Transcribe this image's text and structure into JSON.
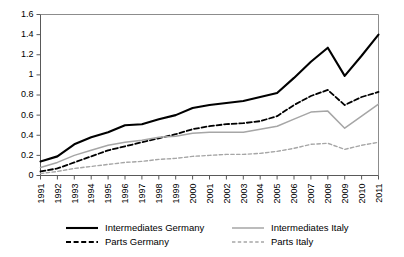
{
  "chart_data": {
    "type": "line",
    "title": "",
    "subtitle": "",
    "xlabel": "",
    "ylabel": "",
    "x": [
      "1991",
      "1992",
      "1993",
      "1994",
      "1995",
      "1996",
      "1997",
      "1998",
      "1999",
      "2000",
      "2001",
      "2002",
      "2003",
      "2004",
      "2005",
      "2006",
      "2007",
      "2008",
      "2009",
      "2010",
      "2011"
    ],
    "categories": [
      "1991",
      "1992",
      "1993",
      "1994",
      "1995",
      "1996",
      "1997",
      "1998",
      "1999",
      "2000",
      "2001",
      "2002",
      "2003",
      "2004",
      "2005",
      "2006",
      "2007",
      "2008",
      "2009",
      "2010",
      "2011"
    ],
    "ylim": [
      0,
      1.6
    ],
    "yticks": [
      "0",
      "0.2",
      "0.4",
      "0.6",
      "0.8",
      "1",
      "1.2",
      "1.4",
      "1.6"
    ],
    "ytick_values": [
      0,
      0.2,
      0.4,
      0.6,
      0.8,
      1.0,
      1.2,
      1.4,
      1.6
    ],
    "grid": false,
    "legend_position": "bottom",
    "series": [
      {
        "name": "Intermediates Germany",
        "style": "solid",
        "color": "#000000",
        "width": 2.1,
        "values": [
          0.14,
          0.19,
          0.31,
          0.38,
          0.43,
          0.5,
          0.51,
          0.56,
          0.6,
          0.67,
          0.7,
          0.72,
          0.74,
          0.78,
          0.82,
          0.97,
          1.13,
          1.27,
          0.99,
          1.19,
          1.4
        ]
      },
      {
        "name": "Parts Germany",
        "style": "dashed",
        "color": "#000000",
        "width": 1.8,
        "values": [
          0.04,
          0.07,
          0.13,
          0.19,
          0.25,
          0.29,
          0.33,
          0.37,
          0.41,
          0.46,
          0.49,
          0.51,
          0.52,
          0.54,
          0.59,
          0.7,
          0.79,
          0.85,
          0.7,
          0.78,
          0.83
        ]
      },
      {
        "name": "Intermediates Italy",
        "style": "solid",
        "color": "#A6A6A6",
        "width": 1.5,
        "values": [
          0.08,
          0.13,
          0.2,
          0.25,
          0.3,
          0.33,
          0.35,
          0.38,
          0.39,
          0.42,
          0.43,
          0.43,
          0.43,
          0.46,
          0.49,
          0.56,
          0.63,
          0.64,
          0.47,
          0.59,
          0.71
        ]
      },
      {
        "name": "Parts Italy",
        "style": "dashed",
        "color": "#A6A6A6",
        "width": 1.4,
        "values": [
          0.02,
          0.04,
          0.07,
          0.09,
          0.11,
          0.13,
          0.14,
          0.16,
          0.17,
          0.19,
          0.2,
          0.21,
          0.21,
          0.22,
          0.24,
          0.27,
          0.31,
          0.32,
          0.26,
          0.3,
          0.33
        ]
      }
    ]
  },
  "legend": {
    "items": [
      {
        "label": "Intermediates Germany",
        "style": "solid",
        "color": "#000000"
      },
      {
        "label": "Parts Germany",
        "style": "dashed",
        "color": "#000000"
      },
      {
        "label": "Intermediates Italy",
        "style": "solid",
        "color": "#A6A6A6"
      },
      {
        "label": "Parts Italy",
        "style": "dashed",
        "color": "#A6A6A6"
      }
    ]
  },
  "colors": {
    "germany": "#000000",
    "italy": "#A6A6A6",
    "axis": "#595959",
    "frame": "#8C8C8C",
    "background": "#FFFFFF"
  }
}
